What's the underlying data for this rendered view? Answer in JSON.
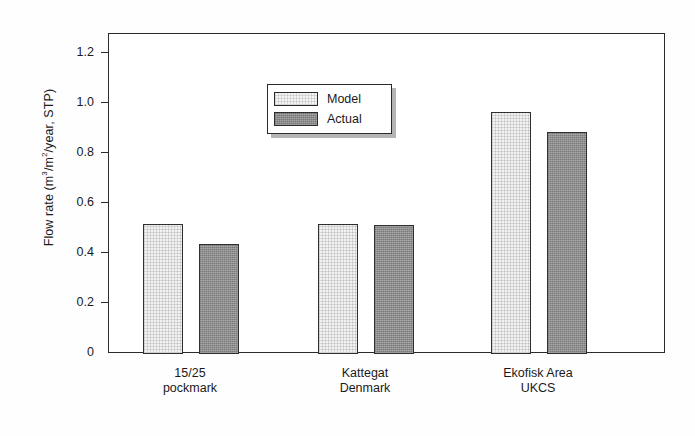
{
  "chart_data": {
    "type": "bar",
    "title": "",
    "xlabel": "",
    "ylabel": "Flow rate (m3/m2/year, STP)",
    "ylabel_parts": {
      "prefix": "Flow rate (m",
      "sup1": "3",
      "mid": "/m",
      "sup2": "2",
      "suffix": "/year, STP)"
    },
    "categories": [
      "15/25 pockmark",
      "Kattegat Denmark",
      "Ekofisk Area UKCS"
    ],
    "category_lines": [
      {
        "line1": "15/25",
        "line2": "pockmark"
      },
      {
        "line1": "Kattegat",
        "line2": "Denmark"
      },
      {
        "line1": "Ekofisk Area",
        "line2": "UKCS"
      }
    ],
    "series": [
      {
        "name": "Model",
        "values": [
          0.52,
          0.52,
          0.97
        ],
        "color": "#f2f2f2"
      },
      {
        "name": "Actual",
        "values": [
          0.44,
          0.515,
          0.89
        ],
        "color": "#8e8e8e"
      }
    ],
    "ylim": [
      0,
      1.3
    ],
    "yticks": [
      0,
      0.2,
      0.4,
      0.6,
      0.8,
      1.0,
      1.2
    ],
    "ytick_labels": [
      "0",
      "0.2",
      "0.4",
      "0.6",
      "0.8",
      "1.0",
      "1.2"
    ],
    "grid": false,
    "legend": {
      "position": "upper-left-inside",
      "entries": [
        {
          "label": "Model",
          "swatch": "light-stipple"
        },
        {
          "label": "Actual",
          "swatch": "dark-stipple"
        }
      ]
    },
    "axis_color": "#2b2b2b",
    "background": "#ffffff"
  }
}
